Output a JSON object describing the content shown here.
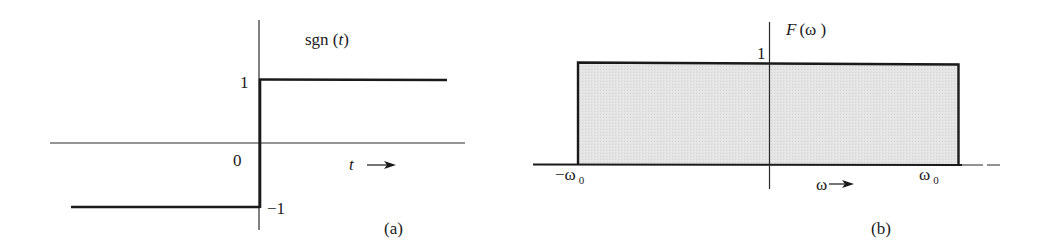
{
  "figure": {
    "panel_a": {
      "function_label": "sgn (",
      "function_var": "t",
      "function_close": ")",
      "y_tick_pos": "1",
      "y_tick_neg": "−1",
      "origin_label": "0",
      "x_axis_var": "t",
      "x_axis_arrow": "→",
      "caption": "(a)"
    },
    "panel_b": {
      "function_label": "F",
      "function_arg": "(ω )",
      "y_tick": "1",
      "left_edge_label": "−ω",
      "left_edge_sub": "0",
      "right_edge_label": "ω",
      "right_edge_sub": "0",
      "x_axis_var": "ω",
      "caption": "(b)"
    },
    "colors": {
      "stroke": "#1a1a1a",
      "fill": "#e2e2e2"
    }
  }
}
